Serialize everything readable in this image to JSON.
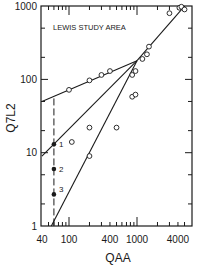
{
  "chart_data": {
    "type": "scatter",
    "title": "LEWIS STUDY AREA",
    "xlabel": "QAA",
    "ylabel": "Q7L2",
    "xscale": "log",
    "yscale": "log",
    "xlim": [
      40,
      6000
    ],
    "ylim": [
      1,
      1000
    ],
    "x_ticks": [
      40,
      100,
      400,
      1000,
      4000
    ],
    "x_tick_labels": [
      "40",
      "100",
      "400",
      "1000",
      "4000"
    ],
    "y_ticks": [
      1,
      10,
      100,
      1000
    ],
    "y_tick_labels": [
      "1",
      "10",
      "100",
      "1000"
    ],
    "grid": false,
    "legend": null,
    "series": [
      {
        "name": "observed",
        "marker": "open-circle",
        "points": [
          [
            100,
            72
          ],
          [
            200,
            97
          ],
          [
            300,
            115
          ],
          [
            400,
            130
          ],
          [
            850,
            115
          ],
          [
            950,
            130
          ],
          [
            1200,
            190
          ],
          [
            1400,
            220
          ],
          [
            1500,
            280
          ],
          [
            3000,
            800
          ],
          [
            4200,
            950
          ],
          [
            4500,
            980
          ],
          [
            5000,
            900
          ],
          [
            850,
            58
          ],
          [
            950,
            62
          ],
          [
            200,
            22
          ],
          [
            500,
            22
          ],
          [
            110,
            14
          ],
          [
            200,
            9
          ]
        ]
      },
      {
        "name": "estimates",
        "marker": "filled-circle",
        "points": [
          [
            60,
            13
          ],
          [
            60,
            6
          ],
          [
            60,
            2.7
          ]
        ],
        "labels": [
          "1",
          "2",
          "3"
        ]
      }
    ],
    "lines": [
      {
        "name": "line-1",
        "points": [
          [
            40,
            50
          ],
          [
            1000,
            180
          ]
        ]
      },
      {
        "name": "line-2",
        "points": [
          [
            40,
            9
          ],
          [
            1000,
            180
          ],
          [
            5000,
            1000
          ]
        ]
      },
      {
        "name": "line-3",
        "points": [
          [
            55,
            1
          ],
          [
            1000,
            180
          ]
        ]
      }
    ],
    "annotations": [
      {
        "type": "dashed-vertical",
        "x": 60,
        "y_from": 1,
        "y_to": 55
      }
    ]
  },
  "labels": {
    "title": "LEWIS STUDY AREA",
    "xlabel": "QAA",
    "ylabel": "Q7L2",
    "point_labels": [
      "1",
      "2",
      "3"
    ]
  }
}
